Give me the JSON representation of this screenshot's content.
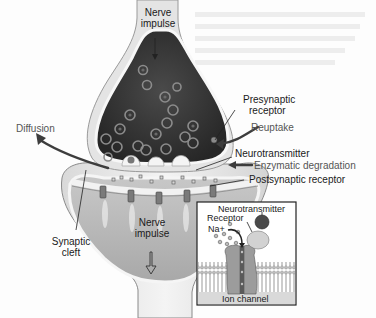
{
  "diagram": {
    "labels": {
      "nerve_impulse_top_1": "Nerve",
      "nerve_impulse_top_2": "impulse",
      "presynaptic_receptor_1": "Presynaptic",
      "presynaptic_receptor_2": "receptor",
      "reuptake": "Reuptake",
      "diffusion": "Diffusion",
      "neurotransmitter": "Neurotransmitter",
      "enzymatic_degradation": "Enzymatic degradation",
      "postsynaptic_receptor": "Postsynaptic receptor",
      "nerve_impulse_bottom_1": "Nerve",
      "nerve_impulse_bottom_2": "impulse",
      "synaptic_cleft_1": "Synaptic",
      "synaptic_cleft_2": "cleft"
    },
    "inset": {
      "neurotransmitter": "Neurotransmitter",
      "receptor": "Receptor",
      "sodium_ion": "Na+",
      "ion_channel": "Ion channel"
    },
    "colors": {
      "membrane": "#e6e6e6",
      "vesicle_fluid": "#3a3a3a",
      "postsynaptic_fill": "#b5b5b5",
      "arrow": "#3d3d3d",
      "process_label": "#555555"
    }
  }
}
